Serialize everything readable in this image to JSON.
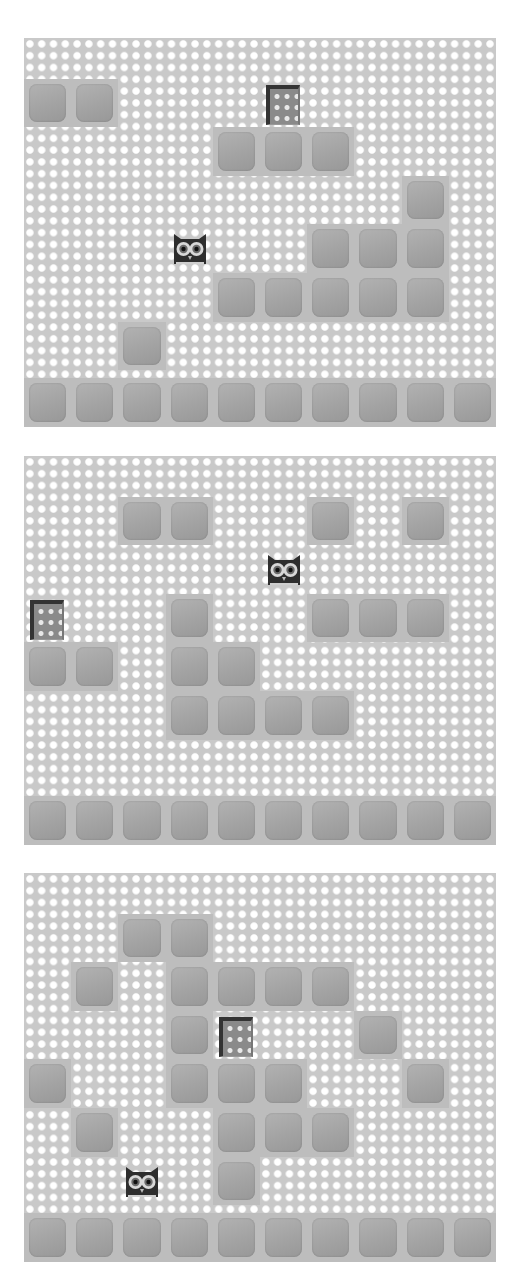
{
  "game": {
    "grid": {
      "columns": 10,
      "rows": 8,
      "cell_width": 47.2,
      "cell_height": 48.6
    },
    "colors": {
      "background": "#c9c9c9",
      "dot": "#ffffff",
      "block": "#a8a8a8",
      "door": "#333333",
      "owl": "#2e2e2e"
    },
    "panels": [
      {
        "id": "panel-1",
        "top": 38,
        "blocks": [
          [
            1,
            0
          ],
          [
            1,
            1
          ],
          [
            2,
            4
          ],
          [
            2,
            5
          ],
          [
            2,
            6
          ],
          [
            3,
            8
          ],
          [
            4,
            6
          ],
          [
            4,
            7
          ],
          [
            4,
            8
          ],
          [
            5,
            4
          ],
          [
            5,
            5
          ],
          [
            5,
            6
          ],
          [
            5,
            7
          ],
          [
            5,
            8
          ],
          [
            6,
            2
          ],
          [
            7,
            0
          ],
          [
            7,
            1
          ],
          [
            7,
            2
          ],
          [
            7,
            3
          ],
          [
            7,
            4
          ],
          [
            7,
            5
          ],
          [
            7,
            6
          ],
          [
            7,
            7
          ],
          [
            7,
            8
          ],
          [
            7,
            9
          ]
        ],
        "door": [
          1,
          5
        ],
        "owl": [
          4,
          3
        ]
      },
      {
        "id": "panel-2",
        "top": 456,
        "blocks": [
          [
            1,
            2
          ],
          [
            1,
            3
          ],
          [
            1,
            6
          ],
          [
            1,
            8
          ],
          [
            3,
            3
          ],
          [
            3,
            6
          ],
          [
            3,
            7
          ],
          [
            3,
            8
          ],
          [
            4,
            0
          ],
          [
            4,
            1
          ],
          [
            4,
            3
          ],
          [
            4,
            4
          ],
          [
            5,
            3
          ],
          [
            5,
            4
          ],
          [
            5,
            5
          ],
          [
            5,
            6
          ],
          [
            7,
            0
          ],
          [
            7,
            1
          ],
          [
            7,
            2
          ],
          [
            7,
            3
          ],
          [
            7,
            4
          ],
          [
            7,
            5
          ],
          [
            7,
            6
          ],
          [
            7,
            7
          ],
          [
            7,
            8
          ],
          [
            7,
            9
          ]
        ],
        "door": [
          3,
          0
        ],
        "owl": [
          2,
          5
        ]
      },
      {
        "id": "panel-3",
        "top": 873,
        "blocks": [
          [
            1,
            2
          ],
          [
            1,
            3
          ],
          [
            2,
            1
          ],
          [
            2,
            3
          ],
          [
            2,
            4
          ],
          [
            2,
            5
          ],
          [
            2,
            6
          ],
          [
            3,
            3
          ],
          [
            3,
            7
          ],
          [
            4,
            0
          ],
          [
            4,
            3
          ],
          [
            4,
            4
          ],
          [
            4,
            5
          ],
          [
            4,
            8
          ],
          [
            5,
            1
          ],
          [
            5,
            4
          ],
          [
            5,
            5
          ],
          [
            5,
            6
          ],
          [
            6,
            4
          ],
          [
            7,
            0
          ],
          [
            7,
            1
          ],
          [
            7,
            2
          ],
          [
            7,
            3
          ],
          [
            7,
            4
          ],
          [
            7,
            5
          ],
          [
            7,
            6
          ],
          [
            7,
            7
          ],
          [
            7,
            8
          ],
          [
            7,
            9
          ]
        ],
        "door": [
          3,
          4
        ],
        "owl": [
          6,
          2
        ]
      }
    ],
    "icons": {
      "player": "owl-icon",
      "goal": "door-icon",
      "tile": "block-tile"
    }
  }
}
